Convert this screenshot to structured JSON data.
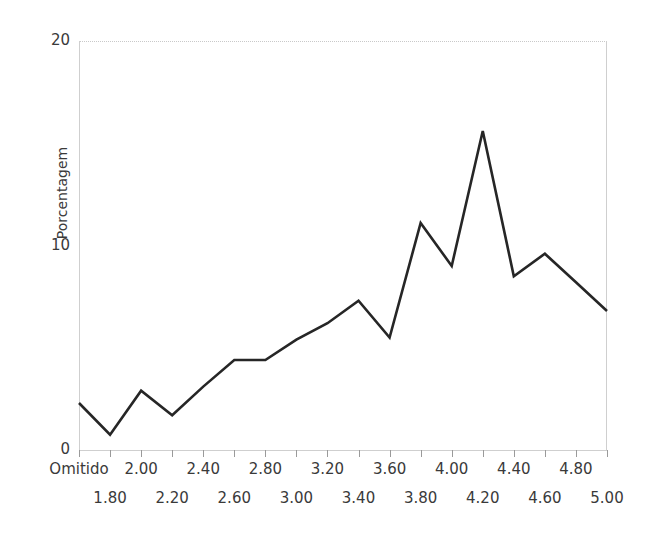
{
  "chart_data": {
    "type": "line",
    "title": "",
    "subtitle": "",
    "xlabel": "",
    "ylabel": "Porcentagem",
    "categories": [
      "Omitido",
      "1.80",
      "2.00",
      "2.20",
      "2.40",
      "2.60",
      "2.80",
      "3.00",
      "3.20",
      "3.40",
      "3.60",
      "3.80",
      "4.00",
      "4.20",
      "4.40",
      "4.60",
      "4.80",
      "5.00"
    ],
    "series": [
      {
        "name": "Porcentagem",
        "values": [
          2.3,
          0.75,
          2.9,
          1.7,
          3.1,
          4.4,
          4.4,
          5.4,
          6.2,
          7.3,
          5.5,
          11.1,
          9.0,
          15.6,
          8.5,
          9.6,
          8.2,
          6.8
        ]
      }
    ],
    "ylim": [
      0,
      20
    ],
    "yticks": [
      0,
      10,
      20
    ],
    "ytick_labels": [
      "0",
      "10",
      "20"
    ],
    "grid": false,
    "legend": "none",
    "line_color": "#262626",
    "line_width": 2.6,
    "axis_color": "#cfcfcf",
    "text_color": "#3a3a3a",
    "background": "#ffffff"
  },
  "axes": {
    "y_title": "Porcentagem",
    "y_ticks": [
      {
        "label": "20",
        "value": 20
      },
      {
        "label": "10",
        "value": 10
      },
      {
        "label": "0",
        "value": 0
      }
    ],
    "x_ticks": [
      {
        "label": "Omitido",
        "row": "top"
      },
      {
        "label": "1.80",
        "row": "bottom"
      },
      {
        "label": "2.00",
        "row": "top"
      },
      {
        "label": "2.20",
        "row": "bottom"
      },
      {
        "label": "2.40",
        "row": "top"
      },
      {
        "label": "2.60",
        "row": "bottom"
      },
      {
        "label": "2.80",
        "row": "top"
      },
      {
        "label": "3.00",
        "row": "bottom"
      },
      {
        "label": "3.20",
        "row": "top"
      },
      {
        "label": "3.40",
        "row": "bottom"
      },
      {
        "label": "3.60",
        "row": "top"
      },
      {
        "label": "3.80",
        "row": "bottom"
      },
      {
        "label": "4.00",
        "row": "top"
      },
      {
        "label": "4.20",
        "row": "bottom"
      },
      {
        "label": "4.40",
        "row": "top"
      },
      {
        "label": "4.60",
        "row": "bottom"
      },
      {
        "label": "4.80",
        "row": "top"
      },
      {
        "label": "5.00",
        "row": "bottom"
      }
    ]
  }
}
